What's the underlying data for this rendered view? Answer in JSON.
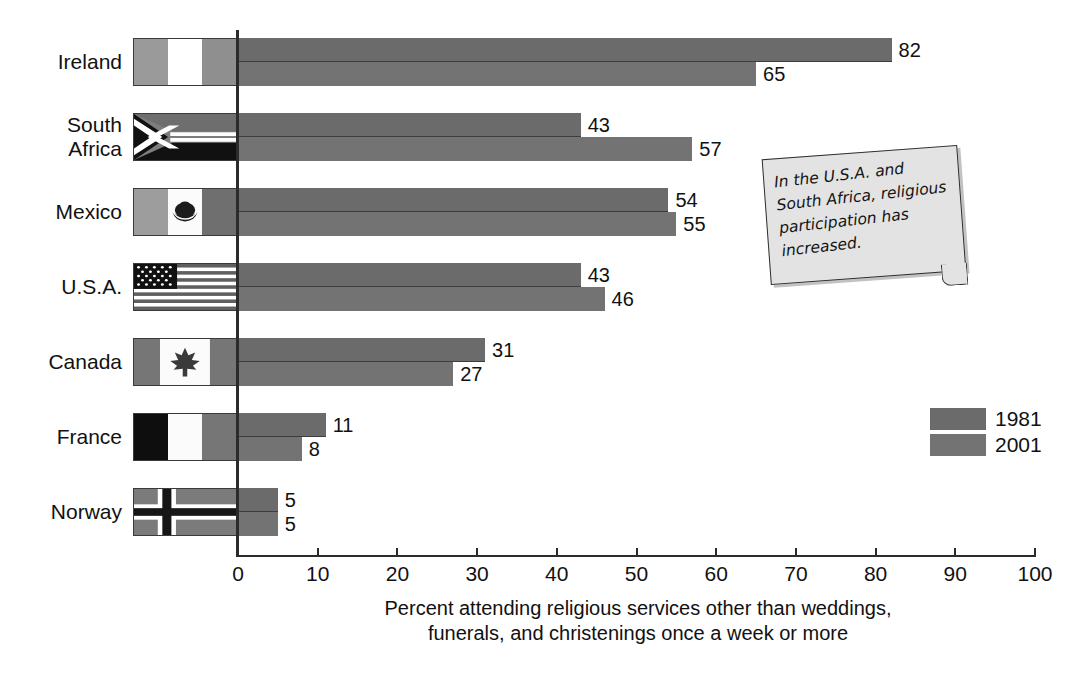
{
  "chart_data": {
    "type": "bar",
    "orientation": "horizontal",
    "title": "",
    "xlabel": "Percent attending religious services other than weddings, funerals, and christenings once a week or more",
    "ylabel": "",
    "xlim": [
      0,
      100
    ],
    "xticks": [
      0,
      10,
      20,
      30,
      40,
      50,
      60,
      70,
      80,
      90,
      100
    ],
    "grid": false,
    "legend_position": "right",
    "categories": [
      "Ireland",
      "South Africa",
      "Mexico",
      "U.S.A.",
      "Canada",
      "France",
      "Norway"
    ],
    "series": [
      {
        "name": "1981",
        "color": "#6b6b6b",
        "values": [
          82,
          43,
          54,
          43,
          31,
          11,
          5
        ]
      },
      {
        "name": "2001",
        "color": "#737373",
        "values": [
          65,
          57,
          55,
          46,
          27,
          8,
          5
        ]
      }
    ],
    "annotations": [
      "In the U.S.A. and South Africa, religious participation has increased."
    ]
  },
  "rows": [
    {
      "label": "Ireland",
      "label_lines": "Ireland",
      "flag": "flag-ireland",
      "v1981": "82",
      "v2001": "65"
    },
    {
      "label": "South Africa",
      "label_lines": "South\nAfrica",
      "flag": "flag-south-africa",
      "v1981": "43",
      "v2001": "57"
    },
    {
      "label": "Mexico",
      "label_lines": "Mexico",
      "flag": "flag-mexico",
      "v1981": "54",
      "v2001": "55"
    },
    {
      "label": "U.S.A.",
      "label_lines": "U.S.A.",
      "flag": "flag-usa",
      "v1981": "43",
      "v2001": "46"
    },
    {
      "label": "Canada",
      "label_lines": "Canada",
      "flag": "flag-canada",
      "v1981": "31",
      "v2001": "27"
    },
    {
      "label": "France",
      "label_lines": "France",
      "flag": "flag-france",
      "v1981": "11",
      "v2001": "8"
    },
    {
      "label": "Norway",
      "label_lines": "Norway",
      "flag": "flag-norway",
      "v1981": "5",
      "v2001": "5"
    }
  ],
  "axis": {
    "tick_labels": [
      "0",
      "10",
      "20",
      "30",
      "40",
      "50",
      "60",
      "70",
      "80",
      "90",
      "100"
    ],
    "title_line1": "Percent attending religious services other than weddings,",
    "title_line2": "funerals, and christenings once a week or more"
  },
  "legend": {
    "items": [
      {
        "label": "1981",
        "color": "#6b6b6b"
      },
      {
        "label": "2001",
        "color": "#737373"
      }
    ]
  },
  "callout": {
    "text": "In the U.S.A. and South Africa, religious participation has increased."
  },
  "colors": {
    "series_1981": "#6b6b6b",
    "series_2001": "#737373",
    "axis": "#2b2b2b",
    "text": "#111111",
    "note_bg": "#e3e3e3"
  }
}
